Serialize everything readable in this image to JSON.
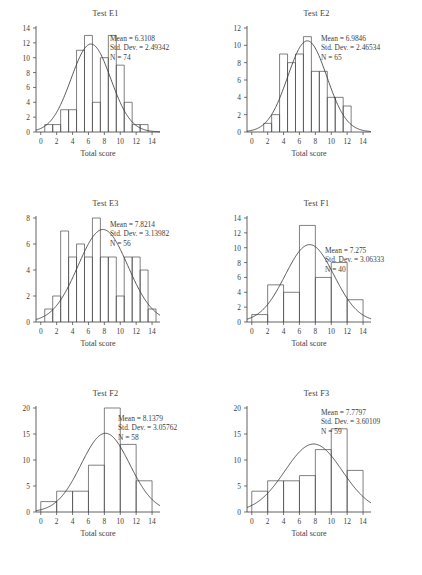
{
  "figure": {
    "panel_count": 6,
    "axis_title": "Total score",
    "label_mean": "Mean = ",
    "label_sd": "Std. Dev. = ",
    "label_n": "N = "
  },
  "chart_data": [
    {
      "type": "bar",
      "title": "Test E1",
      "xlabel": "Total score",
      "ylabel": "",
      "xlim": [
        -0.6,
        15.0
      ],
      "ylim": [
        0,
        14
      ],
      "xticks": [
        0,
        2,
        4,
        6,
        8,
        10,
        12,
        14
      ],
      "yticks": [
        0,
        2,
        4,
        6,
        8,
        10,
        12,
        14
      ],
      "bin_width": 1,
      "bin_starts": [
        0.5,
        1.5,
        2.5,
        3.5,
        4.5,
        5.5,
        6.5,
        7.5,
        8.5,
        9.5,
        10.5,
        11.5,
        12.5
      ],
      "categories": [
        "0.5-1.5",
        "1.5-2.5",
        "2.5-3.5",
        "3.5-4.5",
        "4.5-5.5",
        "5.5-6.5",
        "6.5-7.5",
        "7.5-8.5",
        "8.5-9.5",
        "9.5-10.5",
        "10.5-11.5",
        "11.5-12.5",
        "12.5-13.5"
      ],
      "values": [
        1,
        1,
        3,
        3,
        11,
        13,
        4,
        10,
        13,
        9,
        4,
        1,
        1
      ],
      "stats": {
        "mean": "6.3108",
        "std_dev": "2.49342",
        "n": "74"
      },
      "curve": {
        "type": "normal",
        "mean": 6.3108,
        "sd": 2.49342,
        "n": 74,
        "bin_width": 1
      },
      "grid": false,
      "legend": "none"
    },
    {
      "type": "bar",
      "title": "Test E2",
      "xlabel": "Total score",
      "ylabel": "",
      "xlim": [
        -0.6,
        15.0
      ],
      "ylim": [
        0,
        12
      ],
      "xticks": [
        0,
        2,
        4,
        6,
        8,
        10,
        12,
        14
      ],
      "yticks": [
        0,
        2,
        4,
        6,
        8,
        10,
        12
      ],
      "bin_width": 1,
      "bin_starts": [
        1.5,
        2.5,
        3.5,
        4.5,
        5.5,
        6.5,
        7.5,
        8.5,
        9.5,
        10.5,
        11.5
      ],
      "categories": [
        "1.5-2.5",
        "2.5-3.5",
        "3.5-4.5",
        "4.5-5.5",
        "5.5-6.5",
        "6.5-7.5",
        "7.5-8.5",
        "8.5-9.5",
        "9.5-10.5",
        "10.5-11.5",
        "11.5-12.5"
      ],
      "values": [
        1,
        2,
        9,
        8,
        9,
        11,
        7,
        7,
        4,
        4,
        3
      ],
      "stats": {
        "mean": "6.9846",
        "std_dev": "2.46534",
        "n": "65"
      },
      "curve": {
        "type": "normal",
        "mean": 6.9846,
        "sd": 2.46534,
        "n": 65,
        "bin_width": 1
      },
      "grid": false,
      "legend": "none"
    },
    {
      "type": "bar",
      "title": "Test E3",
      "xlabel": "Total score",
      "ylabel": "",
      "xlim": [
        -0.6,
        15.0
      ],
      "ylim": [
        0,
        8
      ],
      "xticks": [
        0,
        2,
        4,
        6,
        8,
        10,
        12,
        14
      ],
      "yticks": [
        0,
        2,
        4,
        6,
        8
      ],
      "bin_width": 1,
      "bin_starts": [
        0.5,
        1.5,
        2.5,
        3.5,
        4.5,
        5.5,
        6.5,
        7.5,
        8.5,
        9.5,
        10.5,
        11.5,
        12.5,
        13.5
      ],
      "categories": [
        "0.5-1.5",
        "1.5-2.5",
        "2.5-3.5",
        "3.5-4.5",
        "4.5-5.5",
        "5.5-6.5",
        "6.5-7.5",
        "7.5-8.5",
        "8.5-9.5",
        "9.5-10.5",
        "10.5-11.5",
        "11.5-12.5",
        "12.5-13.5",
        "13.5-14.5"
      ],
      "values": [
        1,
        2,
        7,
        5,
        6,
        5,
        8,
        5,
        5,
        2,
        5,
        5,
        4,
        1
      ],
      "stats": {
        "mean": "7.8214",
        "std_dev": "3.13982",
        "n": "56"
      },
      "curve": {
        "type": "normal",
        "mean": 7.8214,
        "sd": 3.13982,
        "n": 56,
        "bin_width": 1
      },
      "grid": false,
      "legend": "none"
    },
    {
      "type": "bar",
      "title": "Test F1",
      "xlabel": "Total score",
      "ylabel": "",
      "xlim": [
        -0.6,
        15.0
      ],
      "ylim": [
        0,
        14
      ],
      "xticks": [
        0,
        2,
        4,
        6,
        8,
        10,
        12,
        14
      ],
      "yticks": [
        0,
        2,
        4,
        6,
        8,
        10,
        12,
        14
      ],
      "bin_width": 2,
      "bin_starts": [
        0,
        2,
        4,
        6,
        8,
        10,
        12
      ],
      "categories": [
        "0-2",
        "2-4",
        "4-6",
        "6-8",
        "8-10",
        "10-12",
        "12-14"
      ],
      "values": [
        1,
        5,
        4,
        13,
        6,
        8,
        3
      ],
      "stats": {
        "mean": "7.275",
        "std_dev": "3.06333",
        "n": "40"
      },
      "curve": {
        "type": "normal",
        "mean": 7.275,
        "sd": 3.06333,
        "n": 40,
        "bin_width": 2
      },
      "grid": false,
      "legend": "none"
    },
    {
      "type": "bar",
      "title": "Test F2",
      "xlabel": "Total score",
      "ylabel": "",
      "xlim": [
        -0.6,
        15.0
      ],
      "ylim": [
        0,
        20
      ],
      "xticks": [
        0,
        2,
        4,
        6,
        8,
        10,
        12,
        14
      ],
      "yticks": [
        0,
        5,
        10,
        15,
        20
      ],
      "bin_width": 2,
      "bin_starts": [
        0,
        2,
        4,
        6,
        8,
        10,
        12
      ],
      "categories": [
        "0-2",
        "2-4",
        "4-6",
        "6-8",
        "8-10",
        "10-12",
        "12-14"
      ],
      "values": [
        2,
        4,
        4,
        9,
        20,
        13,
        6
      ],
      "stats": {
        "mean": "8.1379",
        "std_dev": "3.05762",
        "n": "58"
      },
      "curve": {
        "type": "normal",
        "mean": 8.1379,
        "sd": 3.05762,
        "n": 58,
        "bin_width": 2
      },
      "grid": false,
      "legend": "none"
    },
    {
      "type": "bar",
      "title": "Test F3",
      "xlabel": "Total score",
      "ylabel": "",
      "xlim": [
        -0.6,
        15.0
      ],
      "ylim": [
        0,
        20
      ],
      "xticks": [
        0,
        2,
        4,
        6,
        8,
        10,
        12,
        14
      ],
      "yticks": [
        0,
        5,
        10,
        15,
        20
      ],
      "bin_width": 2,
      "bin_starts": [
        0,
        2,
        4,
        6,
        8,
        10,
        12
      ],
      "categories": [
        "0-2",
        "2-4",
        "4-6",
        "6-8",
        "8-10",
        "10-12",
        "12-14"
      ],
      "values": [
        4,
        6,
        6,
        7,
        12,
        16,
        8
      ],
      "stats": {
        "mean": "7.7797",
        "std_dev": "3.60109",
        "n": "59"
      },
      "curve": {
        "type": "normal",
        "mean": 7.7797,
        "sd": 3.60109,
        "n": 59,
        "bin_width": 2
      },
      "grid": false,
      "legend": "none"
    }
  ]
}
